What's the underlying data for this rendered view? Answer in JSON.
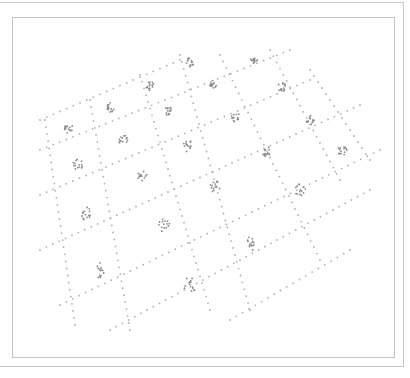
{
  "chart_data": {
    "type": "scatter",
    "title": "",
    "xlabel": "",
    "ylabel": "",
    "grid": false,
    "legend": null,
    "colors": {
      "grid_dots": "#b0b0b0",
      "cluster_dots": "#8a8a8a",
      "frame": "#c4c4c4"
    },
    "grid_lines": [
      {
        "from": [
          40,
          120
        ],
        "to": [
          180,
          60
        ]
      },
      {
        "from": [
          40,
          150
        ],
        "to": [
          290,
          50
        ]
      },
      {
        "from": [
          40,
          195
        ],
        "to": [
          310,
          80
        ]
      },
      {
        "from": [
          40,
          250
        ],
        "to": [
          360,
          105
        ]
      },
      {
        "from": [
          60,
          305
        ],
        "to": [
          380,
          150
        ]
      },
      {
        "from": [
          110,
          330
        ],
        "to": [
          370,
          190
        ]
      },
      {
        "from": [
          230,
          320
        ],
        "to": [
          350,
          250
        ]
      },
      {
        "from": [
          45,
          120
        ],
        "to": [
          75,
          325
        ]
      },
      {
        "from": [
          90,
          100
        ],
        "to": [
          130,
          330
        ]
      },
      {
        "from": [
          140,
          75
        ],
        "to": [
          210,
          310
        ]
      },
      {
        "from": [
          180,
          55
        ],
        "to": [
          250,
          310
        ]
      },
      {
        "from": [
          220,
          55
        ],
        "to": [
          320,
          260
        ]
      },
      {
        "from": [
          270,
          50
        ],
        "to": [
          340,
          180
        ]
      },
      {
        "from": [
          310,
          70
        ],
        "to": [
          370,
          160
        ]
      }
    ],
    "clusters": [
      {
        "x": 68,
        "y": 128
      },
      {
        "x": 110,
        "y": 107
      },
      {
        "x": 150,
        "y": 86
      },
      {
        "x": 190,
        "y": 62
      },
      {
        "x": 254,
        "y": 60
      },
      {
        "x": 78,
        "y": 164
      },
      {
        "x": 124,
        "y": 141
      },
      {
        "x": 168,
        "y": 110
      },
      {
        "x": 213,
        "y": 84
      },
      {
        "x": 282,
        "y": 87
      },
      {
        "x": 87,
        "y": 214
      },
      {
        "x": 142,
        "y": 176
      },
      {
        "x": 188,
        "y": 146
      },
      {
        "x": 236,
        "y": 117
      },
      {
        "x": 310,
        "y": 120
      },
      {
        "x": 342,
        "y": 150
      },
      {
        "x": 100,
        "y": 270
      },
      {
        "x": 164,
        "y": 225
      },
      {
        "x": 215,
        "y": 187
      },
      {
        "x": 266,
        "y": 152
      },
      {
        "x": 300,
        "y": 190
      },
      {
        "x": 190,
        "y": 285
      },
      {
        "x": 252,
        "y": 243
      }
    ]
  }
}
